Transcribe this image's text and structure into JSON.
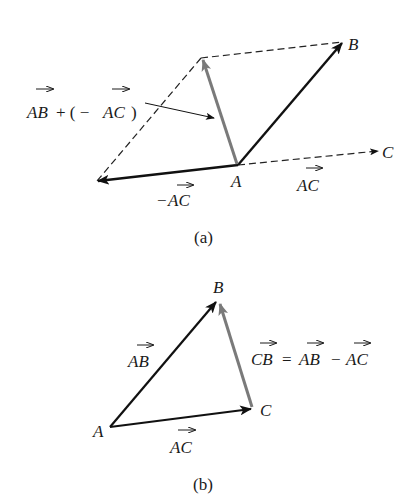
{
  "colors": {
    "vector": "#111111",
    "resultant": "#7a7a7a",
    "dashed": "#222222",
    "background": "#ffffff"
  },
  "figure_a": {
    "caption": "(a)",
    "points": {
      "A": "A",
      "B": "B",
      "C": "C"
    },
    "labels": {
      "sum_AB": "AB",
      "sum_plus": "+ ( −",
      "sum_AC": "AC",
      "sum_close": ")",
      "neg_minus": "−",
      "neg_AC": "AC",
      "AC": "AC"
    },
    "annotation": "AB + ( − AC)"
  },
  "figure_b": {
    "caption": "(b)",
    "points": {
      "A": "A",
      "B": "B",
      "C": "C"
    },
    "labels": {
      "AB": "AB",
      "AC": "AC",
      "eq_CB": "CB",
      "eq_equals": "=",
      "eq_AB": "AB",
      "eq_minus": "−",
      "eq_AC": "AC"
    },
    "equation": "CB = AB − AC"
  }
}
